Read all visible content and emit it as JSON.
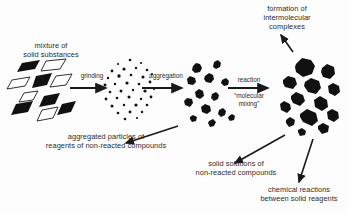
{
  "diagram": {
    "title_label": "mixture of\nsolid substances",
    "labels": {
      "mixture_line1": "mixture of",
      "mixture_line2": "solid substances",
      "formation_line1": "formation of",
      "formation_line2": "intermolecular",
      "formation_line3": "complexes",
      "aggregated_line1": "aggregated particles of",
      "aggregated_line2": "reagents of non-reacted compounds",
      "solid_solutions_line1": "solid solutions of",
      "solid_solutions_line2": "non-reacted compounds",
      "chemical_reactions_line1": "chemical reactions",
      "chemical_reactions_line2": "between solid reagents"
    },
    "arrows": [
      {
        "name": "grinding",
        "label": "grinding",
        "sublabel": ""
      },
      {
        "name": "aggregation",
        "label": "aggregation",
        "sublabel": ""
      },
      {
        "name": "reaction",
        "label": "reaction",
        "sublabel": "“molecular\nmixing”"
      }
    ],
    "arrow_reaction_sub_line1": "“molecular",
    "arrow_reaction_sub_line2": "mixing”",
    "stages": [
      {
        "name": "crystals",
        "description": "parallelogram crystals, mixed black and white"
      },
      {
        "name": "ground-particles",
        "description": "cloud of fine specks"
      },
      {
        "name": "aggregates",
        "description": "small clustered aggregates"
      },
      {
        "name": "complexes",
        "description": "large irregular blobs"
      }
    ],
    "colors": {
      "ink": "#1a1a1a",
      "text": "#2b2b2b",
      "background": "#fdfdfd",
      "particle_fill": "#111111",
      "particle_outline": "#ffffff"
    }
  }
}
